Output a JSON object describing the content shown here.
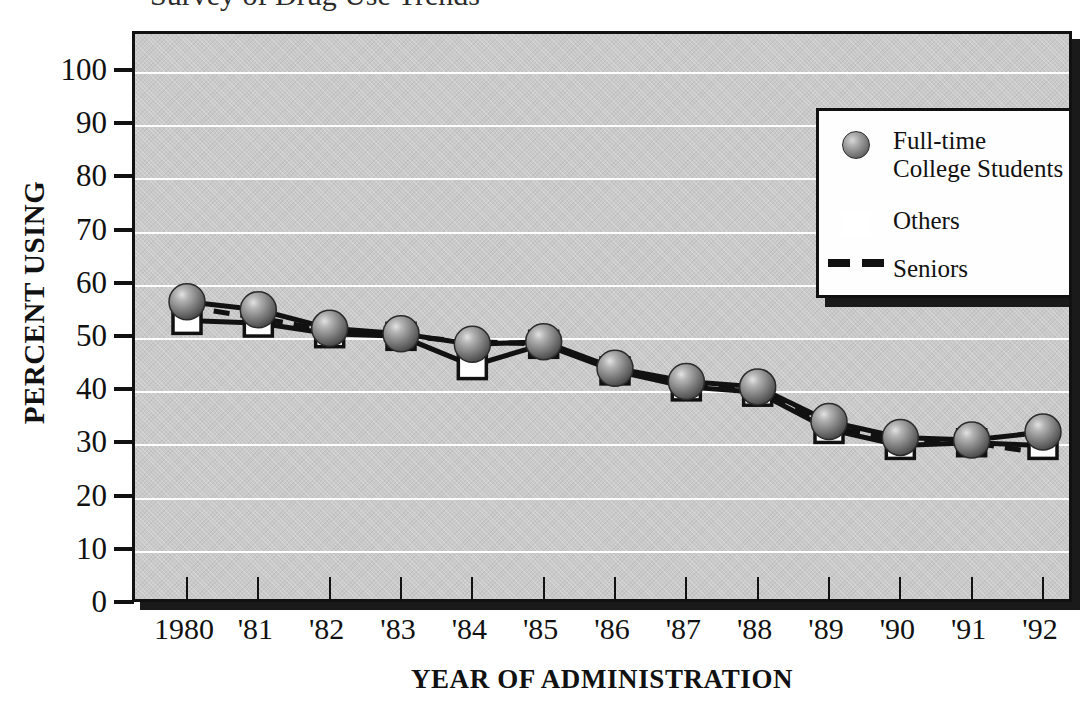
{
  "title_fragment": "Survey of Drug Use Trends",
  "chart_data": {
    "type": "line",
    "title": "",
    "xlabel": "YEAR OF ADMINISTRATION",
    "ylabel": "PERCENT USING",
    "categories": [
      "1980",
      "'81",
      "'82",
      "'83",
      "'84",
      "'85",
      "'86",
      "'87",
      "'88",
      "'89",
      "'90",
      "'91",
      "'92"
    ],
    "ylim": [
      0,
      100
    ],
    "ytick_labels": [
      "0",
      "10",
      "20",
      "30",
      "40",
      "50",
      "60",
      "70",
      "80",
      "90",
      "100"
    ],
    "ytick_values": [
      0,
      10,
      20,
      30,
      40,
      50,
      60,
      70,
      80,
      90,
      100
    ],
    "grid": true,
    "legend_position": "upper-right",
    "series": [
      {
        "name": "Full-time\nCollege Students",
        "marker": "filled-sphere",
        "line_style": "solid",
        "values": [
          57.0,
          55.5,
          52.0,
          51.0,
          49.0,
          49.5,
          44.5,
          42.0,
          41.0,
          34.5,
          31.5,
          31.0,
          32.5
        ]
      },
      {
        "name": "Others",
        "marker": "open-square",
        "line_style": "solid",
        "values": [
          53.5,
          53.0,
          51.0,
          50.5,
          45.0,
          49.0,
          44.0,
          41.0,
          40.0,
          33.0,
          30.0,
          30.5,
          30.0
        ]
      },
      {
        "name": "Seniors",
        "marker": "none",
        "line_style": "dashed",
        "values": [
          56.0,
          54.0,
          51.5,
          50.5,
          49.5,
          49.0,
          44.5,
          41.5,
          40.5,
          33.5,
          31.0,
          30.5,
          28.5
        ]
      }
    ]
  },
  "legend": {
    "items": [
      {
        "label": "Full-time\nCollege Students",
        "marker": "filled-sphere"
      },
      {
        "label": "Others",
        "marker": "open-square"
      },
      {
        "label": "Seniors",
        "marker": "dashed-line"
      }
    ]
  },
  "colors": {
    "plot_background": "#c9c9c9",
    "axis": "#111111",
    "gridline": "#fdfdfd",
    "marker_sphere": "#6e6e6e",
    "marker_square": "#ffffff",
    "shadow": "#1a1a1a",
    "legend_background": "#fefefe"
  }
}
